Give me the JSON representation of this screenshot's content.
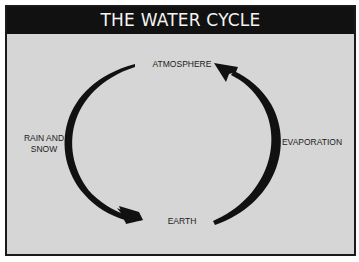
{
  "title": "THE WATER CYCLE",
  "nodes": {
    "top": "ATMOSPHERE",
    "bottom": "EARTH"
  },
  "edges": {
    "left": "RAIN AND\nSNOW",
    "right": "EVAPORATION"
  },
  "colors": {
    "header_bg": "#111111",
    "panel_bg": "#d6d6d6",
    "arrow": "#111111"
  }
}
